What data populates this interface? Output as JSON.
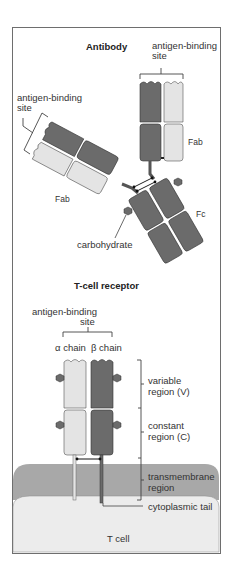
{
  "antibody": {
    "title": "Antibody",
    "antigen_binding_site_top": [
      "antigen-binding",
      "site"
    ],
    "antigen_binding_site_left": [
      "antigen-binding",
      "site"
    ],
    "fab_right": "Fab",
    "fab_left": "Fab",
    "fc": "Fc",
    "carbohydrate": "carbohydrate"
  },
  "tcr": {
    "title": "T-cell receptor",
    "antigen_binding_site": [
      "antigen-binding",
      "site"
    ],
    "alpha_chain": "α chain",
    "beta_chain": "β chain",
    "variable_region": [
      "variable",
      "region (V)"
    ],
    "constant_region": [
      "constant",
      "region (C)"
    ],
    "transmembrane_region": [
      "transmembrane",
      "region"
    ],
    "cytoplasmic_tail": "cytoplasmic tail",
    "t_cell": "T cell"
  },
  "colors": {
    "heavy_chain": "#6b6b6b",
    "light_chain": "#e4e4e4",
    "membrane": "#a8a8a8",
    "cell": "#ececec",
    "frame": "#6e6e6e"
  }
}
